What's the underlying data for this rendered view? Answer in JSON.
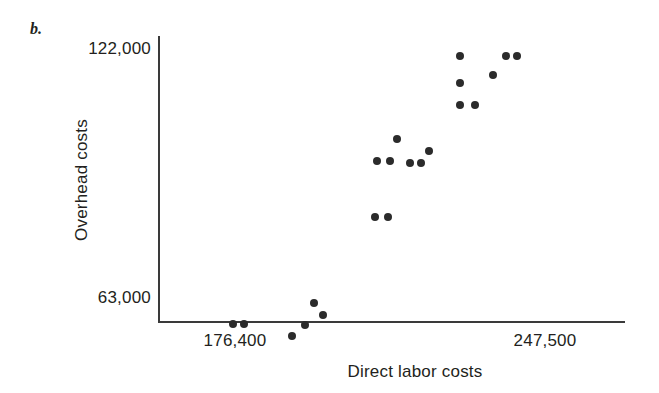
{
  "figure": {
    "panel_letter": "b."
  },
  "chart_data": {
    "type": "scatter",
    "title": "",
    "xlabel": "Direct labor costs",
    "ylabel": "Overhead costs",
    "x_tick_labels": [
      "176,400",
      "247,500"
    ],
    "x_tick_values": [
      176400,
      247500
    ],
    "y_tick_labels": [
      "63,000",
      "122,000"
    ],
    "y_tick_values": [
      63000,
      122000
    ],
    "xlim": [
      171000,
      260000
    ],
    "ylim": [
      57000,
      128000
    ],
    "grid": false,
    "legend": false,
    "marker": "filled-circle",
    "marker_color": "#2b2b2b",
    "points": [
      {
        "x": 176000,
        "y": 56500
      },
      {
        "x": 178500,
        "y": 56500
      },
      {
        "x": 189500,
        "y": 53700
      },
      {
        "x": 192500,
        "y": 56300
      },
      {
        "x": 194500,
        "y": 61500
      },
      {
        "x": 196500,
        "y": 58700
      },
      {
        "x": 208500,
        "y": 81900
      },
      {
        "x": 211500,
        "y": 81900
      },
      {
        "x": 209000,
        "y": 95200
      },
      {
        "x": 213500,
        "y": 100500
      },
      {
        "x": 212000,
        "y": 95200
      },
      {
        "x": 216500,
        "y": 94700
      },
      {
        "x": 219000,
        "y": 94700
      },
      {
        "x": 221000,
        "y": 97700
      },
      {
        "x": 228000,
        "y": 108600
      },
      {
        "x": 228000,
        "y": 113800
      },
      {
        "x": 231500,
        "y": 108600
      },
      {
        "x": 228000,
        "y": 120200
      },
      {
        "x": 235500,
        "y": 115500
      },
      {
        "x": 238500,
        "y": 120200
      },
      {
        "x": 241000,
        "y": 120200
      }
    ]
  }
}
